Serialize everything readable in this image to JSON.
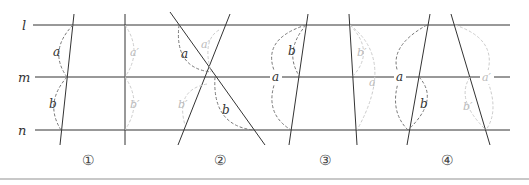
{
  "figure": {
    "parallel_lines": [
      {
        "label": "l",
        "y": 25
      },
      {
        "label": "m",
        "y": 77
      },
      {
        "label": "n",
        "y": 130
      }
    ],
    "panels": [
      {
        "number": "①",
        "angle_labels": {
          "a": "a",
          "b": "b",
          "a_prime": "a′",
          "b_prime": "b′"
        }
      },
      {
        "number": "②",
        "angle_labels": {
          "a": "a",
          "b": "b",
          "a_prime": "a′",
          "b_prime": "b′"
        }
      },
      {
        "number": "③",
        "angle_labels": {
          "a": "a",
          "b": "b",
          "a_prime": "a′",
          "b_prime": "b′"
        }
      },
      {
        "number": "④",
        "angle_labels": {
          "a": "a",
          "b": "b",
          "a_prime": "a′",
          "b_prime": "b′"
        }
      }
    ],
    "colors": {
      "line": "#333333",
      "arc_dark": "#777777",
      "arc_light": "#c8c8c8",
      "label_dark": "#333333",
      "label_light": "#bbbbbb"
    }
  }
}
